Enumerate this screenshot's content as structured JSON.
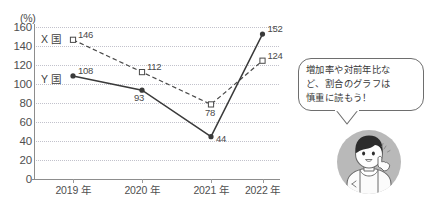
{
  "chart_data": {
    "type": "line",
    "title": "",
    "xlabel": "",
    "ylabel": "(%)",
    "unit_label": "(%)",
    "categories": [
      "2019 年",
      "2020 年",
      "2021 年",
      "2022 年"
    ],
    "ylim": [
      0,
      160
    ],
    "ytick_step": 20,
    "yticks": [
      "160",
      "140",
      "120",
      "100",
      "80",
      "60",
      "40",
      "20",
      "0"
    ],
    "grid": true,
    "grid_style": "dotted",
    "legend_position": "inline-left",
    "series": [
      {
        "name": "X 国",
        "label": "X 国",
        "style": "dashed",
        "marker": "open-square",
        "color": "#4a4a4a",
        "values": [
          146,
          112,
          78,
          124
        ],
        "value_labels": [
          "146",
          "112",
          "78",
          "124"
        ]
      },
      {
        "name": "Y 国",
        "label": "Y 国",
        "style": "solid",
        "marker": "filled-circle",
        "color": "#3a3a3a",
        "values": [
          108,
          93,
          44,
          152
        ],
        "value_labels": [
          "108",
          "93",
          "44",
          "152"
        ]
      }
    ]
  },
  "top_fragment": "",
  "callout": {
    "lines": [
      "増加率や対前年比な",
      "ど、割合のグラフは",
      "慎重に読もう！"
    ],
    "text": "増加率や対前年比など、割合のグラフは慎重に読もう！"
  },
  "avatar": {
    "description": "character-illustration"
  },
  "colors": {
    "grid": "#c2c2cc",
    "axis": "#8d8d8d",
    "text": "#4a4a4a",
    "bubble_border": "#6e6e6e",
    "avatar_bg": "#b9b9b9"
  }
}
